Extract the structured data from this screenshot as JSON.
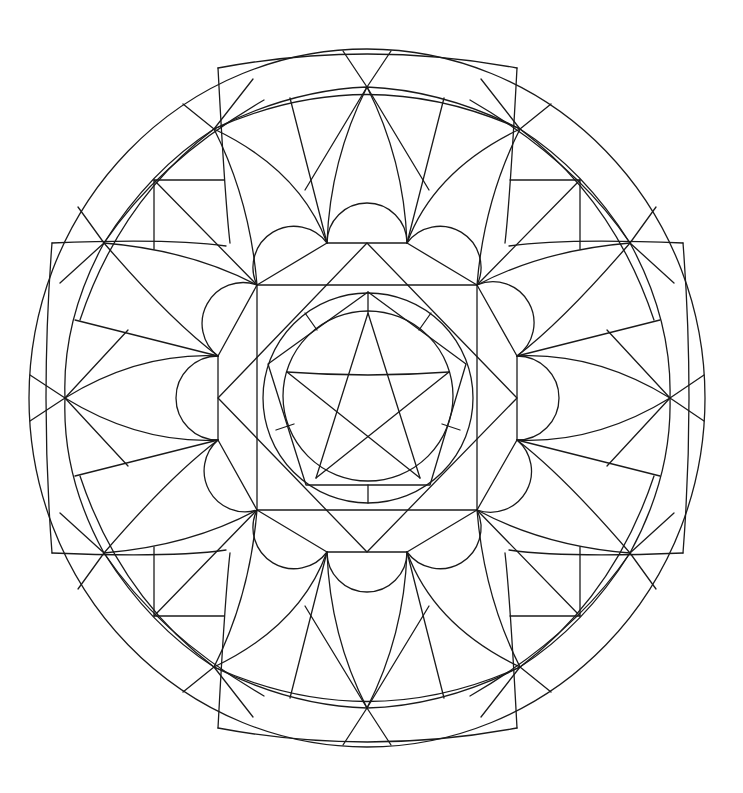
{
  "image": {
    "title": "Geometric mandala coloring page",
    "width": 743,
    "height": 793,
    "background": "#ffffff",
    "line_color": "#1a1a1a",
    "line_width": 1.3
  },
  "mandala": {
    "center": [
      367,
      398
    ],
    "outer_circle": {
      "rx": 338,
      "ry": 349
    },
    "ring_points": [
      [
        367,
        87
      ],
      [
        520,
        129
      ],
      [
        630,
        243
      ],
      [
        670,
        398
      ],
      [
        630,
        553
      ],
      [
        520,
        667
      ],
      [
        367,
        708
      ],
      [
        214,
        667
      ],
      [
        104,
        553
      ],
      [
        65,
        398
      ],
      [
        104,
        243
      ],
      [
        214,
        129
      ]
    ],
    "octagon_hubs": [
      [
        327,
        243
      ],
      [
        407,
        243
      ],
      [
        477,
        285
      ],
      [
        517,
        356
      ],
      [
        517,
        440
      ],
      [
        477,
        510
      ],
      [
        407,
        552
      ],
      [
        327,
        552
      ],
      [
        257,
        510
      ],
      [
        218,
        440
      ],
      [
        218,
        356
      ],
      [
        257,
        285
      ]
    ],
    "inner_square": [
      [
        257,
        285
      ],
      [
        477,
        285
      ],
      [
        477,
        510
      ],
      [
        257,
        510
      ]
    ],
    "diamond": [
      [
        367,
        243
      ],
      [
        517,
        398
      ],
      [
        367,
        552
      ],
      [
        218,
        398
      ]
    ],
    "pentagram_outer_circle": {
      "cx": 368,
      "cy": 398,
      "r": 105
    },
    "pentagram_inner_circle": {
      "cx": 368,
      "cy": 396,
      "r": 85
    },
    "pentagon": [
      [
        368,
        292
      ],
      [
        466,
        364
      ],
      [
        430,
        485
      ],
      [
        306,
        485
      ],
      [
        268,
        364
      ]
    ],
    "center_motif": "pentagram"
  }
}
